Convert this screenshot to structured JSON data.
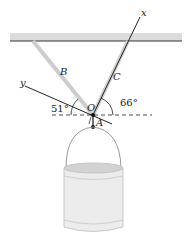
{
  "diagram": {
    "labels": {
      "x_axis": "x",
      "y_axis": "y",
      "cable_b": "B",
      "cable_c": "C",
      "origin": "O",
      "point_a": "A"
    },
    "angles": {
      "cable_b_angle": "51°",
      "cable_c_angle": "66°"
    },
    "colors": {
      "ceiling": "#d9d9d9",
      "cable": "#cfcfcf",
      "line": "#222222",
      "bucket": "#e6e6e6"
    }
  }
}
